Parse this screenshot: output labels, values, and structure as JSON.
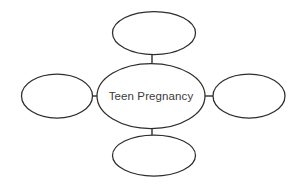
{
  "diagram": {
    "type": "concept-map",
    "title": "",
    "background_color": "#ffffff",
    "stroke_color": "#2d2d2d",
    "text_color": "#3b3b3b",
    "center_node": {
      "id": "center",
      "label": "Teen Pregnancy",
      "shape": "ellipse",
      "cx": 151,
      "cy": 96,
      "rx": 54,
      "ry": 32.5
    },
    "branch_nodes": [
      {
        "id": "top",
        "label": "",
        "shape": "ellipse",
        "position": "top",
        "cx": 154,
        "cy": 33,
        "rx": 41.5,
        "ry": 21.5
      },
      {
        "id": "right",
        "label": "",
        "shape": "ellipse",
        "position": "right",
        "cx": 249,
        "cy": 96,
        "rx": 36,
        "ry": 22
      },
      {
        "id": "bottom",
        "label": "",
        "shape": "ellipse",
        "position": "bottom",
        "cx": 154,
        "cy": 155.5,
        "rx": 41.5,
        "ry": 20.5
      },
      {
        "id": "left",
        "label": "",
        "shape": "ellipse",
        "position": "left",
        "cx": 57,
        "cy": 96,
        "rx": 35.5,
        "ry": 22
      }
    ],
    "connectors": [
      {
        "id": "center-top",
        "from": "center",
        "to": "top",
        "x1": 152,
        "y1": 63.5,
        "x2": 152,
        "y2": 55
      },
      {
        "id": "center-right",
        "from": "center",
        "to": "right",
        "x1": 205,
        "y1": 96,
        "x2": 213,
        "y2": 96
      },
      {
        "id": "center-bottom",
        "from": "center",
        "to": "bottom",
        "x1": 152,
        "y1": 128.5,
        "x2": 152,
        "y2": 135
      },
      {
        "id": "center-left",
        "from": "center",
        "to": "left",
        "x1": 92.5,
        "y1": 96,
        "x2": 97,
        "y2": 96
      }
    ]
  }
}
